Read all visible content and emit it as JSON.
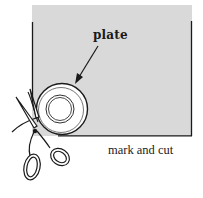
{
  "illustration": {
    "labels": {
      "plate": "plate",
      "caption": "mark and cut"
    },
    "colors": {
      "paper": "#d9d9d9",
      "ink": "#1a1a1a",
      "background": "#ffffff",
      "plate_fill": "#ffffff"
    },
    "elements": [
      "gray-paper-sheet",
      "plate-circle",
      "arrow-pointer",
      "scissors-icon"
    ]
  }
}
